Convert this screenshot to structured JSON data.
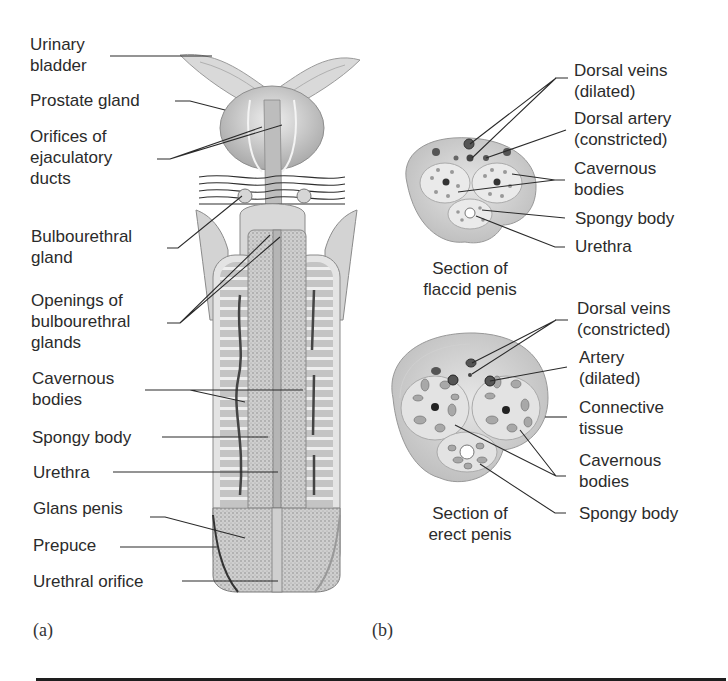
{
  "figure": {
    "panel_a": {
      "letter": "(a)",
      "labels": [
        {
          "line1": "Urinary",
          "line2": "bladder"
        },
        {
          "line1": "Prostate gland"
        },
        {
          "line1": "Orifices of",
          "line2": "ejaculatory",
          "line3": "ducts"
        },
        {
          "line1": "Bulbourethral",
          "line2": "gland"
        },
        {
          "line1": "Openings of",
          "line2": "bulbourethral",
          "line3": "glands"
        },
        {
          "line1": "Cavernous",
          "line2": "bodies"
        },
        {
          "line1": "Spongy body"
        },
        {
          "line1": "Urethra"
        },
        {
          "line1": "Glans penis"
        },
        {
          "line1": "Prepuce"
        },
        {
          "line1": "Urethral orifice"
        }
      ]
    },
    "panel_b": {
      "letter": "(b)",
      "flaccid": {
        "caption_line1": "Section of",
        "caption_line2": "flaccid penis",
        "labels": [
          {
            "line1": "Dorsal veins",
            "line2": "(dilated)"
          },
          {
            "line1": "Dorsal artery",
            "line2": "(constricted)"
          },
          {
            "line1": "Cavernous",
            "line2": "bodies"
          },
          {
            "line1": "Spongy body"
          },
          {
            "line1": "Urethra"
          }
        ]
      },
      "erect": {
        "caption_line1": "Section of",
        "caption_line2": "erect penis",
        "labels": [
          {
            "line1": "Dorsal veins",
            "line2": "(constricted)"
          },
          {
            "line1": "Artery",
            "line2": "(dilated)"
          },
          {
            "line1": "Connective",
            "line2": "tissue"
          },
          {
            "line1": "Cavernous",
            "line2": "bodies"
          },
          {
            "line1": "Spongy body"
          }
        ]
      }
    },
    "colors": {
      "tissue_light": "#dcdcdc",
      "tissue_mid": "#b9b9b9",
      "tissue_dark": "#7a7a7a",
      "vessel": "#3a3a3a",
      "text": "#2b2b2b"
    }
  }
}
